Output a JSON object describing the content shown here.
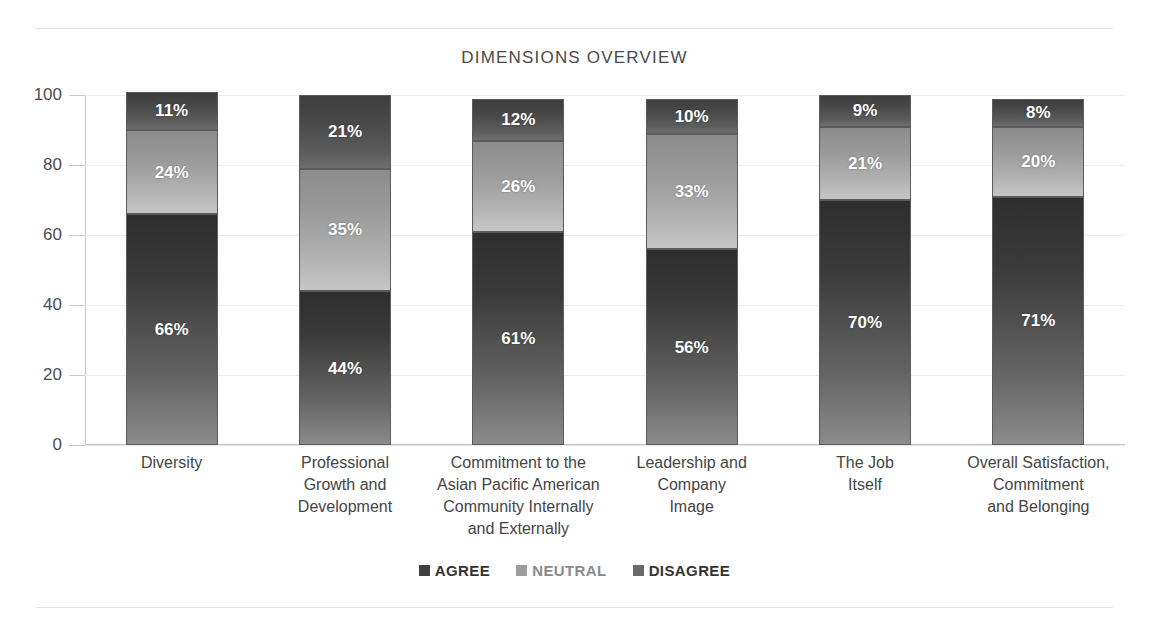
{
  "chart_data": {
    "type": "bar",
    "subtype": "stacked-column-100",
    "title": "DIMENSIONS OVERVIEW",
    "xlabel": "",
    "ylabel": "",
    "ylim": [
      0,
      100
    ],
    "yticks": [
      0,
      20,
      40,
      60,
      80,
      100
    ],
    "ytick_labels": [
      "0",
      "20",
      "40",
      "60",
      "80",
      "100"
    ],
    "grid": true,
    "legend_position": "bottom",
    "categories": [
      "Diversity",
      "Professional Growth and Development",
      "Commitment to the Asian Pacific American Community Internally and Externally",
      "Leadership and Company Image",
      "The Job Itself",
      "Overall Satisfaction, Commitment and Belonging"
    ],
    "category_lines": [
      [
        "Diversity"
      ],
      [
        "Professional",
        "Growth and",
        "Development"
      ],
      [
        "Commitment to the",
        "Asian Pacific American",
        "Community Internally",
        "and Externally"
      ],
      [
        "Leadership and",
        "Company",
        "Image"
      ],
      [
        "The Job",
        "Itself"
      ],
      [
        "Overall Satisfaction,",
        "Commitment",
        "and Belonging"
      ]
    ],
    "series": [
      {
        "name": "AGREE",
        "color": "#3a3a3a",
        "values": [
          66,
          44,
          61,
          56,
          70,
          71
        ],
        "labels": [
          "66%",
          "44%",
          "61%",
          "56%",
          "70%",
          "71%"
        ]
      },
      {
        "name": "NEUTRAL",
        "color": "#a8a8a8",
        "values": [
          24,
          35,
          26,
          33,
          21,
          20
        ],
        "labels": [
          "24%",
          "35%",
          "26%",
          "33%",
          "21%",
          "20%"
        ]
      },
      {
        "name": "DISAGREE",
        "color": "#4e4e4e",
        "values": [
          11,
          21,
          12,
          10,
          9,
          8
        ],
        "labels": [
          "11%",
          "21%",
          "12%",
          "10%",
          "9%",
          "8%"
        ]
      }
    ]
  },
  "legend": {
    "items": [
      {
        "label": "AGREE"
      },
      {
        "label": "NEUTRAL"
      },
      {
        "label": "DISAGREE"
      }
    ]
  },
  "colors": {
    "agree": "#3a3a3a",
    "neutral": "#a8a8a8",
    "disagree": "#4e4e4e",
    "grid": "#ececec",
    "axis": "#c0c0c0",
    "text": "#454545"
  }
}
